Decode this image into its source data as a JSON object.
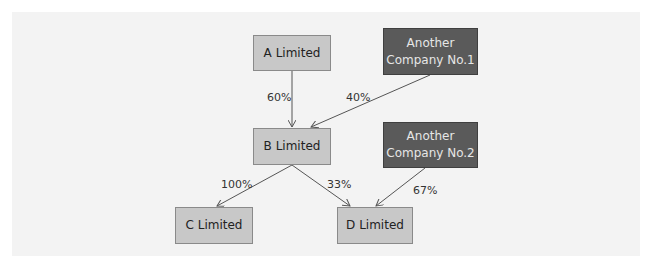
{
  "diagram": {
    "type": "ownership-structure",
    "nodes": [
      {
        "id": "a",
        "label": "A Limited",
        "style": "light"
      },
      {
        "id": "another1",
        "label": "Another Company No.1",
        "line1": "Another",
        "line2": "Company No.1",
        "style": "dark"
      },
      {
        "id": "b",
        "label": "B Limited",
        "style": "light"
      },
      {
        "id": "another2",
        "label": "Another Company No.2",
        "line1": "Another",
        "line2": "Company No.2",
        "style": "dark"
      },
      {
        "id": "c",
        "label": "C Limited",
        "style": "light"
      },
      {
        "id": "d",
        "label": "D Limited",
        "style": "light"
      }
    ],
    "edges": [
      {
        "from": "a",
        "to": "b",
        "label": "60%"
      },
      {
        "from": "another1",
        "to": "b",
        "label": "40%"
      },
      {
        "from": "b",
        "to": "c",
        "label": "100%"
      },
      {
        "from": "b",
        "to": "d",
        "label": "33%"
      },
      {
        "from": "another2",
        "to": "d",
        "label": "67%"
      }
    ],
    "colors": {
      "light_box": "#c8c8c8",
      "dark_box": "#5a5a5a",
      "background": "#f3f3f3",
      "edge": "#555555"
    }
  }
}
